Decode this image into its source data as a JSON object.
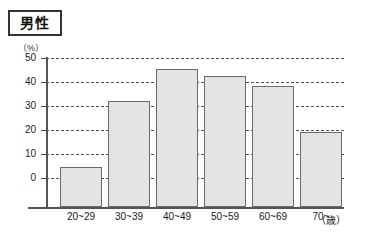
{
  "title": {
    "label": "男性"
  },
  "axes": {
    "y_unit": "（%）",
    "x_unit": "（歳）",
    "y_ticks": [
      "50",
      "40",
      "30",
      "20",
      "10",
      "0"
    ]
  },
  "chart_data": {
    "type": "bar",
    "title": "男性",
    "xlabel": "（歳）",
    "ylabel": "（%）",
    "ylim": [
      0,
      50
    ],
    "yticks": [
      0,
      10,
      20,
      30,
      40,
      50
    ],
    "grid": true,
    "legend": "none",
    "categories": [
      "20~29",
      "30~39",
      "40~49",
      "50~59",
      "60~69",
      "70~"
    ],
    "values": [
      4.5,
      32,
      45.5,
      42.5,
      38.5,
      19
    ],
    "series": [
      {
        "name": "男性",
        "values": [
          4.5,
          32,
          45.5,
          42.5,
          38.5,
          19
        ]
      }
    ],
    "colors": {
      "bar_fill": "#e4e4e4",
      "bar_border": "#6b6b6b",
      "grid": "#555555",
      "axis": "#555555"
    }
  }
}
